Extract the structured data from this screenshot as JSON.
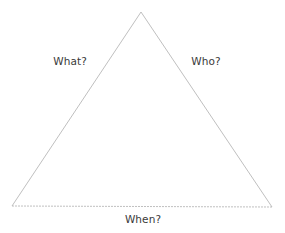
{
  "diagram": {
    "type": "triangle",
    "vertices": {
      "apex": [
        141,
        12
      ],
      "bottom_left": [
        12,
        206
      ],
      "bottom_right": [
        272,
        207
      ]
    },
    "stroke_color": "#b8b8b8",
    "text_color": "#3a3a3a",
    "labels": {
      "left_side": "What?",
      "right_side": "Who?",
      "base": "When?"
    }
  }
}
